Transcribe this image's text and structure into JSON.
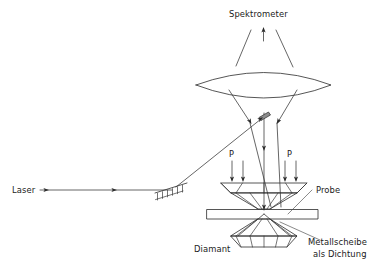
{
  "diagram": {
    "title": "Spektrometer",
    "labels": {
      "spectrometer": "Spektrometer",
      "laser": "Laser",
      "probe": "Probe",
      "diamond": "Diamant",
      "gasket_line1": "Metallscheibe",
      "gasket_line2": "als Dichtung",
      "pressure_left": "P",
      "pressure_right": "P"
    },
    "colors": {
      "stroke": "#2b2b2b",
      "ray": "#333333",
      "leader": "#4a4a4a",
      "mirror_fill": "#8d8d8d",
      "background": "#ffffff",
      "text": "#1a1a1a"
    },
    "components": [
      {
        "name": "spectrometer-label",
        "kind": "text"
      },
      {
        "name": "collection-lens",
        "kind": "lens"
      },
      {
        "name": "beamsplitter-mirror",
        "kind": "mirror"
      },
      {
        "name": "steering-mirror",
        "kind": "hatched-mirror"
      },
      {
        "name": "upper-diamond-anvil",
        "kind": "diamond"
      },
      {
        "name": "lower-diamond-anvil",
        "kind": "diamond"
      },
      {
        "name": "metal-gasket",
        "kind": "plate"
      },
      {
        "name": "sample-probe",
        "kind": "sample"
      }
    ]
  }
}
